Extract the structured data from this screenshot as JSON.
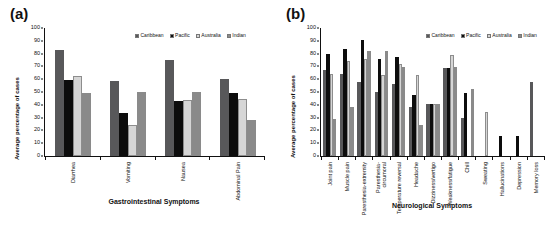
{
  "figure": {
    "panel_a_tag": "(a)",
    "panel_b_tag": "(b)"
  },
  "legend": {
    "items": [
      {
        "label": "Caribbean",
        "color": "#58585a"
      },
      {
        "label": "Pacific",
        "color": "#0d0d0d"
      },
      {
        "label": "Australia",
        "color": "#d6d6d6"
      },
      {
        "label": "Indian",
        "color": "#8a8a8a"
      }
    ]
  },
  "chart_data": [
    {
      "type": "bar",
      "panel": "(a)",
      "title": "",
      "xlabel": "Gastrointestinal Symptoms",
      "ylabel": "Average percentage of cases",
      "ylim": [
        0,
        100
      ],
      "ytick_labels": [
        "0",
        "10",
        "20",
        "30",
        "40",
        "50",
        "60",
        "70",
        "80",
        "90",
        "100"
      ],
      "grid": false,
      "legend_position": "top-right",
      "categories": [
        "Diarrhea",
        "Vomiting",
        "Nausea",
        "Abdominal Pain"
      ],
      "series": [
        {
          "name": "Caribbean",
          "color": "#58585a",
          "values": [
            83,
            58.5,
            75,
            60.5
          ]
        },
        {
          "name": "Pacific",
          "color": "#0d0d0d",
          "values": [
            59.5,
            33.5,
            43,
            49
          ]
        },
        {
          "name": "Australia",
          "color": "#d6d6d6",
          "values": [
            62.5,
            24.5,
            44,
            44.5
          ]
        },
        {
          "name": "Indian",
          "color": "#8a8a8a",
          "values": [
            49,
            50,
            50,
            28.5
          ]
        }
      ]
    },
    {
      "type": "bar",
      "panel": "(b)",
      "title": "",
      "xlabel": "Neurological Symptoms",
      "ylabel": "Average percentage of cases",
      "ylim": [
        0,
        100
      ],
      "ytick_labels": [
        "0",
        "10",
        "20",
        "30",
        "40",
        "50",
        "60",
        "70",
        "80",
        "90",
        "100"
      ],
      "grid": false,
      "legend_position": "top-right",
      "categories": [
        "Joint pain",
        "Muscle pain",
        "Paresthesia-extremity",
        "Paresthesia-\ncircumoral",
        "Temperature reversal",
        "Headache",
        "Dizziness/vertigo",
        "Weakness/fatigue",
        "Chill",
        "Sweating",
        "Hallucinations",
        "Depression",
        "Memory loss"
      ],
      "series": [
        {
          "name": "Caribbean",
          "color": "#58585a",
          "values": [
            67,
            64,
            57.5,
            50,
            56.5,
            38.5,
            40.5,
            69,
            29.5,
            0,
            0,
            0,
            57.5
          ]
        },
        {
          "name": "Pacific",
          "color": "#0d0d0d",
          "values": [
            80,
            83.5,
            91,
            76,
            77,
            48,
            41,
            69,
            49.5,
            0,
            16,
            16,
            0
          ]
        },
        {
          "name": "Australia",
          "color": "#d6d6d6",
          "values": [
            64,
            74,
            76,
            63.5,
            72,
            63.5,
            40.5,
            79,
            0,
            34,
            0,
            0,
            0
          ]
        },
        {
          "name": "Indian",
          "color": "#8a8a8a",
          "values": [
            29,
            38,
            82,
            82,
            69.5,
            24.5,
            40.5,
            69.5,
            52,
            0,
            0,
            0,
            0
          ]
        }
      ]
    }
  ]
}
